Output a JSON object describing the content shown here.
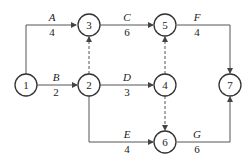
{
  "nodes": [
    {
      "id": "1",
      "label": "1"
    },
    {
      "id": "2",
      "label": "2"
    },
    {
      "id": "3",
      "label": "3"
    },
    {
      "id": "4",
      "label": "4"
    },
    {
      "id": "5",
      "label": "5"
    },
    {
      "id": "6",
      "label": "6"
    },
    {
      "id": "7",
      "label": "7"
    }
  ],
  "activities": {
    "A": {
      "name": "A",
      "duration": "4",
      "from": "1",
      "to": "3"
    },
    "B": {
      "name": "B",
      "duration": "2",
      "from": "1",
      "to": "2"
    },
    "C": {
      "name": "C",
      "duration": "6",
      "from": "3",
      "to": "5"
    },
    "D": {
      "name": "D",
      "duration": "3",
      "from": "2",
      "to": "4"
    },
    "E": {
      "name": "E",
      "duration": "4",
      "from": "2",
      "to": "6"
    },
    "F": {
      "name": "F",
      "duration": "4",
      "from": "5",
      "to": "7"
    },
    "G": {
      "name": "G",
      "duration": "6",
      "from": "6",
      "to": "7"
    }
  },
  "dummies": [
    {
      "from": "2",
      "to": "3"
    },
    {
      "from": "4",
      "to": "5"
    },
    {
      "from": "4",
      "to": "6"
    }
  ]
}
